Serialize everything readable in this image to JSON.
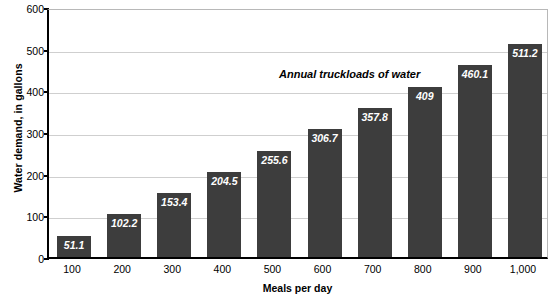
{
  "chart_data": {
    "type": "bar",
    "title": "",
    "annotation": "Annual truckloads of water",
    "xlabel": "Meals per day",
    "ylabel": "Water demand, in gallons",
    "categories": [
      "100",
      "200",
      "300",
      "400",
      "500",
      "600",
      "700",
      "800",
      "900",
      "1,000"
    ],
    "values": [
      51.1,
      102.2,
      153.4,
      204.5,
      255.6,
      306.7,
      357.8,
      409,
      460.1,
      511.2
    ],
    "value_labels": [
      "51.1",
      "102.2",
      "153.4",
      "204.5",
      "255.6",
      "306.7",
      "357.8",
      "409",
      "460.1",
      "511.2"
    ],
    "ylim": [
      0,
      600
    ],
    "yticks": [
      0,
      100,
      200,
      300,
      400,
      500,
      600
    ],
    "ytick_labels": [
      "0",
      "100",
      "200",
      "300",
      "400",
      "500",
      "600"
    ],
    "grid": true,
    "legend": "none",
    "bar_color": "#3d3d3d",
    "value_label_color": "#ffffff",
    "gridline_color": "#cfcfcf",
    "axis_color": "#000000",
    "background_color": "#ffffff"
  }
}
